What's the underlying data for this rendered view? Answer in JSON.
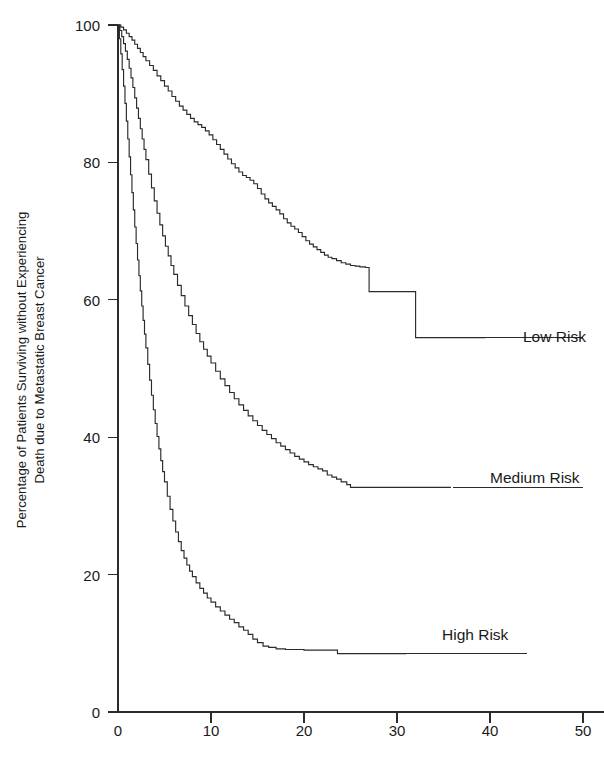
{
  "chart_data": {
    "type": "line",
    "title": "",
    "subtitle": "",
    "xlabel": "",
    "ylabel_line1": "Percentage of Patients Surviving without Experiencing",
    "ylabel_line2": "Death due to Metastatic Breast Cancer",
    "xlim": [
      0,
      52
    ],
    "ylim": [
      0,
      100
    ],
    "xticks": [
      0,
      10,
      20,
      30,
      40,
      50
    ],
    "xticklabels": [
      "0",
      "10",
      "20",
      "30",
      "40",
      "50"
    ],
    "yticks": [
      0,
      20,
      40,
      60,
      80,
      100
    ],
    "yticklabels": [
      "0",
      "20",
      "40",
      "60",
      "80",
      "100"
    ],
    "grid": false,
    "legend_position": "right-inline-labels",
    "curve_style": "kaplan-meier step",
    "series": [
      {
        "name": "Low Risk",
        "label": "Low Risk",
        "color": "#2b2b2b",
        "label_x": 51.0,
        "label_y": 54.5,
        "leader_x0": 34.8,
        "leader_x1": 50.0,
        "points": [
          [
            0.0,
            100.0
          ],
          [
            0.3,
            99.7
          ],
          [
            0.6,
            99.3
          ],
          [
            0.9,
            98.8
          ],
          [
            1.2,
            98.3
          ],
          [
            1.5,
            97.8
          ],
          [
            1.8,
            97.2
          ],
          [
            2.1,
            96.6
          ],
          [
            2.4,
            96.0
          ],
          [
            2.7,
            95.4
          ],
          [
            3.0,
            94.8
          ],
          [
            3.4,
            94.1
          ],
          [
            3.8,
            93.4
          ],
          [
            4.2,
            92.6
          ],
          [
            4.6,
            91.9
          ],
          [
            5.0,
            91.1
          ],
          [
            5.4,
            90.4
          ],
          [
            5.8,
            89.6
          ],
          [
            6.2,
            88.9
          ],
          [
            6.6,
            88.2
          ],
          [
            7.0,
            87.6
          ],
          [
            7.4,
            87.0
          ],
          [
            7.8,
            86.4
          ],
          [
            8.2,
            85.9
          ],
          [
            8.6,
            85.5
          ],
          [
            9.0,
            85.1
          ],
          [
            9.4,
            84.6
          ],
          [
            9.8,
            84.0
          ],
          [
            10.2,
            83.3
          ],
          [
            10.6,
            82.6
          ],
          [
            11.0,
            81.9
          ],
          [
            11.4,
            81.2
          ],
          [
            11.8,
            80.5
          ],
          [
            12.2,
            79.8
          ],
          [
            12.6,
            79.2
          ],
          [
            13.0,
            78.6
          ],
          [
            13.4,
            78.1
          ],
          [
            13.8,
            77.8
          ],
          [
            14.2,
            77.4
          ],
          [
            14.6,
            76.9
          ],
          [
            15.0,
            76.2
          ],
          [
            15.4,
            75.4
          ],
          [
            15.8,
            74.7
          ],
          [
            16.2,
            74.1
          ],
          [
            16.6,
            73.6
          ],
          [
            17.0,
            73.1
          ],
          [
            17.4,
            72.5
          ],
          [
            17.8,
            71.8
          ],
          [
            18.2,
            71.2
          ],
          [
            18.6,
            70.7
          ],
          [
            19.0,
            70.3
          ],
          [
            19.4,
            69.8
          ],
          [
            19.8,
            69.2
          ],
          [
            20.2,
            68.6
          ],
          [
            20.6,
            68.1
          ],
          [
            21.0,
            67.7
          ],
          [
            21.4,
            67.3
          ],
          [
            21.8,
            66.9
          ],
          [
            22.2,
            66.5
          ],
          [
            22.6,
            66.2
          ],
          [
            23.0,
            66.0
          ],
          [
            23.5,
            65.7
          ],
          [
            24.0,
            65.4
          ],
          [
            24.5,
            65.2
          ],
          [
            25.0,
            65.0
          ],
          [
            25.5,
            64.9
          ],
          [
            26.0,
            64.8
          ],
          [
            26.6,
            64.7
          ],
          [
            27.0,
            61.2
          ],
          [
            28.0,
            61.2
          ],
          [
            29.0,
            61.2
          ],
          [
            30.0,
            61.2
          ],
          [
            31.0,
            61.2
          ],
          [
            31.9,
            61.2
          ],
          [
            32.0,
            54.5
          ],
          [
            34.0,
            54.5
          ],
          [
            36.0,
            54.5
          ],
          [
            38.0,
            54.5
          ],
          [
            39.5,
            54.5
          ]
        ]
      },
      {
        "name": "Medium Risk",
        "label": "Medium Risk",
        "color": "#2b2b2b",
        "label_x": 51.0,
        "label_y": 32.7,
        "leader_x0": 36.0,
        "leader_x1": 50.0,
        "points": [
          [
            0.0,
            100.0
          ],
          [
            0.2,
            99.2
          ],
          [
            0.4,
            98.3
          ],
          [
            0.6,
            97.3
          ],
          [
            0.8,
            96.2
          ],
          [
            1.0,
            95.0
          ],
          [
            1.2,
            93.7
          ],
          [
            1.4,
            92.3
          ],
          [
            1.6,
            90.9
          ],
          [
            1.8,
            89.4
          ],
          [
            2.0,
            87.9
          ],
          [
            2.2,
            86.4
          ],
          [
            2.4,
            84.9
          ],
          [
            2.6,
            83.4
          ],
          [
            2.8,
            81.9
          ],
          [
            3.0,
            80.4
          ],
          [
            3.3,
            78.3
          ],
          [
            3.6,
            76.3
          ],
          [
            3.9,
            74.4
          ],
          [
            4.2,
            72.6
          ],
          [
            4.5,
            70.9
          ],
          [
            4.8,
            69.3
          ],
          [
            5.1,
            67.8
          ],
          [
            5.4,
            66.4
          ],
          [
            5.7,
            65.0
          ],
          [
            6.0,
            63.7
          ],
          [
            6.4,
            62.1
          ],
          [
            6.8,
            60.6
          ],
          [
            7.2,
            59.1
          ],
          [
            7.6,
            57.7
          ],
          [
            8.0,
            56.4
          ],
          [
            8.4,
            55.1
          ],
          [
            8.8,
            53.9
          ],
          [
            9.2,
            52.8
          ],
          [
            9.6,
            51.8
          ],
          [
            10.0,
            50.8
          ],
          [
            10.5,
            49.6
          ],
          [
            11.0,
            48.5
          ],
          [
            11.5,
            47.5
          ],
          [
            12.0,
            46.5
          ],
          [
            12.5,
            45.6
          ],
          [
            13.0,
            44.7
          ],
          [
            13.5,
            43.9
          ],
          [
            14.0,
            43.1
          ],
          [
            14.5,
            42.4
          ],
          [
            15.0,
            41.7
          ],
          [
            15.5,
            41.0
          ],
          [
            16.0,
            40.4
          ],
          [
            16.5,
            39.8
          ],
          [
            17.0,
            39.2
          ],
          [
            17.5,
            38.7
          ],
          [
            18.0,
            38.2
          ],
          [
            18.5,
            37.7
          ],
          [
            19.0,
            37.2
          ],
          [
            19.5,
            36.8
          ],
          [
            20.0,
            36.4
          ],
          [
            20.5,
            36.0
          ],
          [
            21.0,
            35.7
          ],
          [
            21.5,
            35.4
          ],
          [
            22.0,
            35.1
          ],
          [
            22.5,
            34.5
          ],
          [
            23.0,
            34.2
          ],
          [
            23.5,
            33.9
          ],
          [
            24.0,
            33.5
          ],
          [
            24.6,
            33.1
          ],
          [
            25.0,
            32.7
          ],
          [
            26.0,
            32.7
          ],
          [
            28.0,
            32.7
          ],
          [
            30.0,
            32.7
          ],
          [
            32.0,
            32.7
          ],
          [
            34.0,
            32.7
          ],
          [
            35.8,
            32.7
          ]
        ]
      },
      {
        "name": "High Risk",
        "label": "High Risk",
        "color": "#2b2b2b",
        "label_x": 45.0,
        "label_y": 8.5,
        "leader_x0": 31.0,
        "leader_x1": 44.0,
        "points": [
          [
            0.0,
            100.0
          ],
          [
            0.15,
            98.0
          ],
          [
            0.3,
            95.8
          ],
          [
            0.45,
            93.5
          ],
          [
            0.6,
            91.1
          ],
          [
            0.75,
            88.6
          ],
          [
            0.9,
            86.0
          ],
          [
            1.05,
            83.4
          ],
          [
            1.2,
            80.8
          ],
          [
            1.35,
            78.2
          ],
          [
            1.5,
            75.6
          ],
          [
            1.65,
            73.1
          ],
          [
            1.8,
            70.6
          ],
          [
            1.95,
            68.2
          ],
          [
            2.1,
            65.8
          ],
          [
            2.25,
            63.5
          ],
          [
            2.4,
            61.3
          ],
          [
            2.55,
            59.1
          ],
          [
            2.7,
            57.0
          ],
          [
            2.85,
            55.0
          ],
          [
            3.0,
            53.0
          ],
          [
            3.2,
            50.6
          ],
          [
            3.4,
            48.3
          ],
          [
            3.6,
            46.1
          ],
          [
            3.8,
            44.0
          ],
          [
            4.0,
            42.0
          ],
          [
            4.2,
            40.1
          ],
          [
            4.4,
            38.3
          ],
          [
            4.6,
            36.6
          ],
          [
            4.8,
            35.0
          ],
          [
            5.0,
            33.5
          ],
          [
            5.3,
            31.4
          ],
          [
            5.6,
            29.5
          ],
          [
            5.9,
            27.8
          ],
          [
            6.2,
            26.2
          ],
          [
            6.5,
            24.8
          ],
          [
            6.8,
            23.5
          ],
          [
            7.1,
            22.4
          ],
          [
            7.4,
            21.4
          ],
          [
            7.7,
            20.5
          ],
          [
            8.0,
            19.7
          ],
          [
            8.4,
            18.8
          ],
          [
            8.8,
            18.0
          ],
          [
            9.2,
            17.3
          ],
          [
            9.6,
            16.6
          ],
          [
            10.0,
            16.0
          ],
          [
            10.5,
            15.3
          ],
          [
            11.0,
            14.7
          ],
          [
            11.5,
            14.1
          ],
          [
            12.0,
            13.5
          ],
          [
            12.5,
            13.0
          ],
          [
            13.0,
            12.4
          ],
          [
            13.5,
            11.9
          ],
          [
            14.0,
            11.3
          ],
          [
            14.5,
            10.6
          ],
          [
            15.0,
            10.1
          ],
          [
            15.6,
            9.6
          ],
          [
            16.2,
            9.4
          ],
          [
            17.0,
            9.2
          ],
          [
            18.0,
            9.1
          ],
          [
            20.0,
            9.0
          ],
          [
            22.0,
            9.0
          ],
          [
            23.4,
            9.0
          ],
          [
            23.6,
            8.5
          ],
          [
            26.0,
            8.5
          ],
          [
            28.0,
            8.5
          ],
          [
            30.0,
            8.5
          ],
          [
            31.0,
            8.5
          ]
        ]
      }
    ]
  },
  "axes": {
    "y_axis_label_line1": "Percentage of Patients Surviving without Experiencing",
    "y_axis_label_line2": "Death due to Metastatic Breast Cancer",
    "y_tick_0": "0",
    "y_tick_20": "20",
    "y_tick_40": "40",
    "y_tick_60": "60",
    "y_tick_80": "80",
    "y_tick_100": "100",
    "x_tick_0": "0",
    "x_tick_10": "10",
    "x_tick_20": "20",
    "x_tick_30": "30",
    "x_tick_40": "40",
    "x_tick_50": "50"
  },
  "legend": {
    "low": "Low Risk",
    "medium": "Medium Risk",
    "high": "High Risk"
  },
  "colors": {
    "line": "#2b2b2b",
    "text": "#1a1a1a",
    "background": "#ffffff"
  }
}
